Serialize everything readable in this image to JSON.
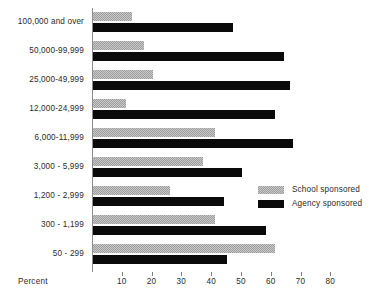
{
  "chart_data": {
    "type": "bar",
    "orientation": "horizontal",
    "title": "",
    "xlabel": "Percent",
    "ylabel": "",
    "xlim": [
      0,
      85
    ],
    "xticks": [
      10,
      20,
      30,
      40,
      50,
      60,
      70,
      80
    ],
    "grid": false,
    "legend_position": "right-middle",
    "categories": [
      "100,000 and over",
      "50,000-99,999",
      "25,000-49,999",
      "12,000-24,999",
      "6,000-11,999",
      "3,000 - 5,999",
      "1,200 - 2,999",
      "300 -  1,199",
      "50 -   299"
    ],
    "series": [
      {
        "name": "School sponsored",
        "values": [
          13,
          17,
          20,
          11,
          41,
          37,
          26,
          41,
          61
        ]
      },
      {
        "name": "Agency sponsored",
        "values": [
          47,
          64,
          66,
          61,
          67,
          50,
          44,
          58,
          45
        ]
      }
    ]
  },
  "axis": {
    "x_title": "Percent",
    "tick_labels": [
      "10",
      "20",
      "30",
      "40",
      "50",
      "60",
      "70",
      "80"
    ]
  },
  "legend": {
    "items": [
      {
        "label": "School sponsored",
        "swatch": "hatched-gray",
        "color": "#c9c9c9"
      },
      {
        "label": "Agency sponsored",
        "swatch": "solid-black",
        "color": "#0a0a0a"
      }
    ]
  }
}
